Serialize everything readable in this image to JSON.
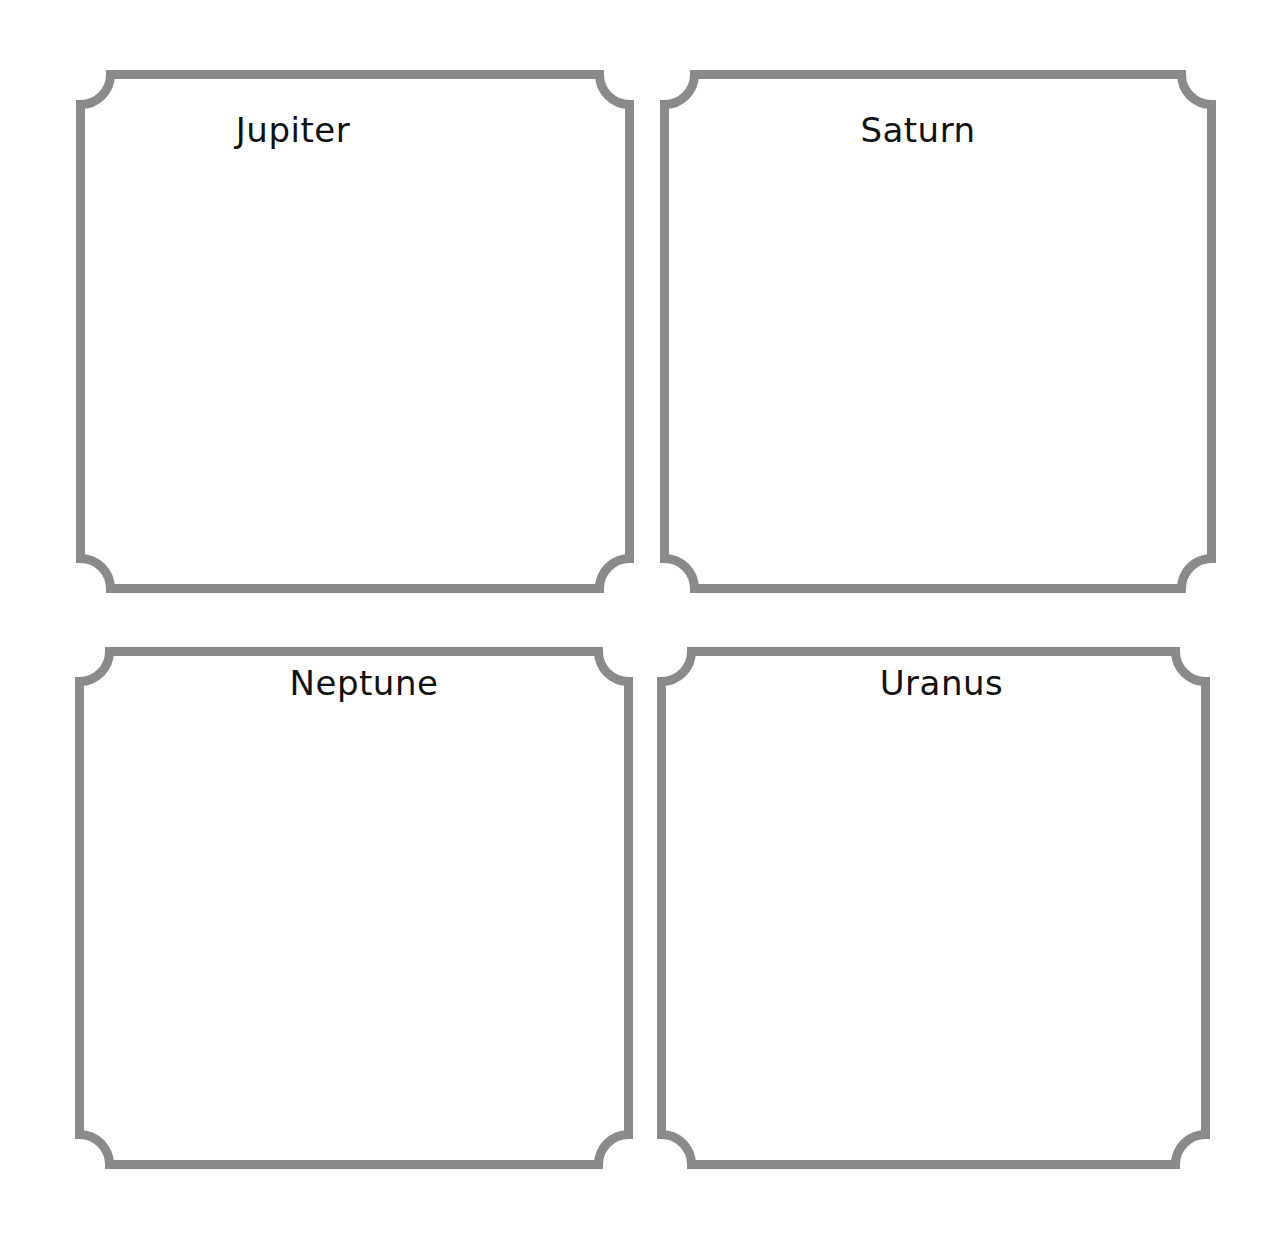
{
  "page": {
    "background": "#ffffff"
  },
  "frame_style": {
    "stroke_color": "#8a8a8a",
    "stroke_width": 9,
    "corner_radius": 30
  },
  "frames": [
    {
      "title": "Jupiter",
      "x": 76,
      "y": 70,
      "w": 558,
      "h": 523,
      "title_offset_x": -62,
      "title_top": 40
    },
    {
      "title": "Saturn",
      "x": 660,
      "y": 70,
      "w": 556,
      "h": 523,
      "title_offset_x": -20,
      "title_top": 40
    },
    {
      "title": "Neptune",
      "x": 75,
      "y": 647,
      "w": 558,
      "h": 522,
      "title_offset_x": 10,
      "title_top": 16
    },
    {
      "title": "Uranus",
      "x": 657,
      "y": 647,
      "w": 553,
      "h": 522,
      "title_offset_x": 8,
      "title_top": 16
    }
  ]
}
